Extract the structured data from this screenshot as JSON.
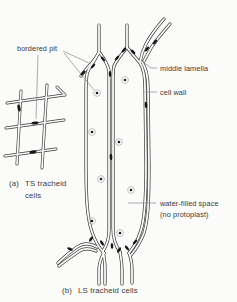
{
  "figure": {
    "colors": {
      "ink": "#3a3a3a",
      "paper": "#fbfbfa",
      "pit": "#161616",
      "leader": "#8a8a8a",
      "dot": "#1c1c1c",
      "dot_ring": "#b5b5b5",
      "text": "#3a3a3a"
    },
    "labels": {
      "bordered_pit": "bordered pit",
      "middle_lamella": "middle lamella",
      "cell_wall": "cell wall",
      "water_filled_line1": "water-filled space",
      "water_filled_line2": "(no protoplast)",
      "caption_a_prefix": "(a)",
      "caption_a_line1": "TS tracheid",
      "caption_a_line2": "cells",
      "caption_b_prefix": "(b)",
      "caption_b_text": "LS tracheid cells"
    }
  }
}
